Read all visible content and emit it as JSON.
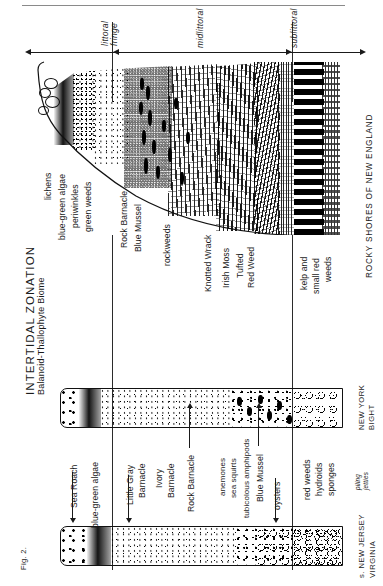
{
  "figure": {
    "number": "Fig. 2.",
    "title": "INTERTIDAL ZONATION",
    "subtitle": "Balanoid-Thallophyte Biome"
  },
  "zones": [
    {
      "id": "supralittoral",
      "label": "",
      "arrow": "left"
    },
    {
      "id": "littoral-fringe",
      "label": "littoral\nfringe",
      "label_line1": "littoral",
      "label_line2": "fringe"
    },
    {
      "id": "midlittoral",
      "label": "midlittoral"
    },
    {
      "id": "sublittoral",
      "label": "sublittoral"
    }
  ],
  "zone_labels": {
    "littoral_fringe_l1": "littoral",
    "littoral_fringe_l2": "fringe",
    "midlittoral": "midlittoral",
    "sublittoral": "sublittoral"
  },
  "panels": [
    {
      "id": "rocky-shores-new-england",
      "region_label": "ROCKY SHORES OF NEW ENGLAND",
      "species": [
        "lichens",
        "blue-green algae",
        "periwinkles",
        "green weeds",
        "Rock Barnacle",
        "Blue Mussel",
        "rockweeds",
        "Knotted Wrack",
        "Irish Moss",
        "Tufted",
        "Red Weed",
        "kelp and",
        "small red",
        "weeds"
      ]
    },
    {
      "id": "new-york-bight",
      "region_label_l1": "NEW YORK",
      "region_label_l2": "BIGHT"
    },
    {
      "id": "south-new-jersey-virginia",
      "region_label_l1": "s. NEW JERSEY",
      "region_label_l2": "VIRGINIA",
      "substrate_l1": "piling",
      "substrate_l2": "jetties",
      "species": [
        "Sea Roach",
        "blue-green algae",
        "Little Gray",
        "Barnacle",
        "Ivory",
        "Barnacle",
        "Rock Barnacle",
        "anemones",
        "sea squirts",
        "tubicolous amphipods",
        "Blue Mussel",
        "oysters",
        "red weeds",
        "hydroids",
        "sponges"
      ]
    }
  ],
  "labels": {
    "lichens": "lichens",
    "blue_green_algae": "blue-green algae",
    "periwinkles": "periwinkles",
    "green_weeds": "green weeds",
    "rock_barnacle": "Rock Barnacle",
    "blue_mussel": "Blue Mussel",
    "rockweeds": "rockweeds",
    "knotted_wrack": "Knotted Wrack",
    "irish_moss": "Irish Moss",
    "tufted": "Tufted",
    "red_weed": "Red Weed",
    "kelp_and": "kelp and",
    "small_red": "small red",
    "weeds": "weeds",
    "sea_roach": "Sea Roach",
    "blue_green_algae2": "blue-green algae",
    "little_gray": "Little Gray",
    "barnacle1": "Barnacle",
    "ivory": "Ivory",
    "barnacle2": "Barnacle",
    "rock_barnacle2": "Rock Barnacle",
    "anemones": "anemones",
    "sea_squirts": "sea squirts",
    "tubicolous_amphipods": "tubicolous amphipods",
    "blue_mussel2": "Blue Mussel",
    "oysters": "oysters",
    "red_weeds": "red weeds",
    "hydroids": "hydroids",
    "sponges": "sponges",
    "piling": "piling",
    "jetties": "jetties",
    "rocky_shores": "ROCKY SHORES OF NEW ENGLAND",
    "new_york_l1": "NEW YORK",
    "new_york_l2": "BIGHT",
    "nj_l1": "s. NEW JERSEY",
    "nj_l2": "VIRGINIA"
  },
  "colors": {
    "ink": "#1a1a1a",
    "rule": "#8a8a8a",
    "paper": "#ffffff"
  }
}
